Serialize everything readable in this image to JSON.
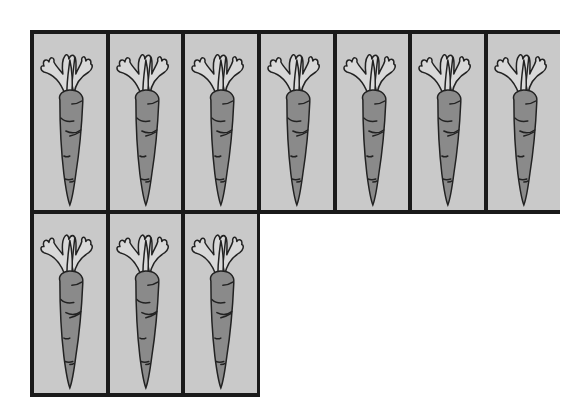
{
  "picture": {
    "description": "Carrot counting grid",
    "item": "carrot",
    "item_icon": "carrot-icon",
    "total_count": 10,
    "rows": [
      {
        "count": 7,
        "columns": 7
      },
      {
        "count": 3,
        "columns": 3
      }
    ],
    "colors": {
      "border": "#1a1a1a",
      "cell_background": "#c9c9c9",
      "carrot_body": "#8a8a8a",
      "carrot_leaves": "#d9d9d9",
      "outline": "#222222",
      "page_background": "#ffffff"
    }
  }
}
